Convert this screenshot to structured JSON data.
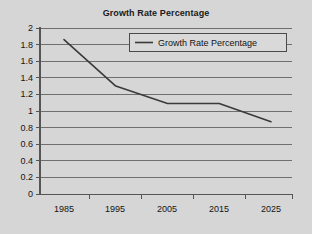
{
  "chart_data": {
    "type": "line",
    "title": "Growth Rate Percentage",
    "xlabel": "",
    "ylabel": "",
    "x": [
      1985,
      1995,
      2005,
      2015,
      2025
    ],
    "categories": [
      "1985",
      "1995",
      "2005",
      "2015",
      "2025"
    ],
    "series": [
      {
        "name": "Growth Rate Percentage",
        "values": [
          1.86,
          1.3,
          1.09,
          1.09,
          0.87
        ],
        "color": "#3a3a3a"
      }
    ],
    "values": [
      1.86,
      1.3,
      1.09,
      1.09,
      0.87
    ],
    "xlim": [
      1985,
      2025
    ],
    "ylim": [
      0,
      2
    ],
    "ytick_labels": [
      "2",
      "1.8",
      "1.6",
      "1.4",
      "1.2",
      "1",
      "0.8",
      "0.6",
      "0.4",
      "0.2",
      "0"
    ],
    "ytick_values": [
      2,
      1.8,
      1.6,
      1.4,
      1.2,
      1,
      0.8,
      0.6,
      0.4,
      0.2,
      0
    ],
    "xtick_labels": [
      "1985",
      "1995",
      "2005",
      "2015",
      "2025"
    ],
    "grid": true,
    "grid_orientation": "horizontal",
    "legend": {
      "position": "top-center-inside",
      "entries": [
        {
          "label": "Growth Rate Percentage",
          "marker": "line",
          "color": "#3a3a3a"
        }
      ]
    },
    "colors": {
      "background": "#d6d6d6",
      "plot_background": "#d6d6d6",
      "grid": "#6f6f6f",
      "axis": "#555555",
      "text": "#141414",
      "series": "#3a3a3a"
    }
  }
}
